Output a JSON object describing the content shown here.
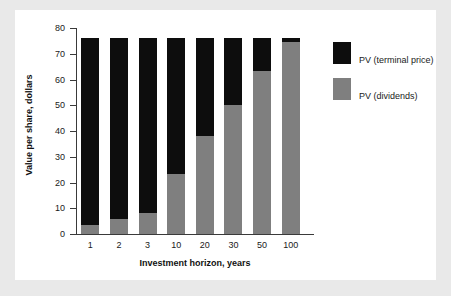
{
  "figure": {
    "background_color": "#e9e9e9",
    "panel_color": "#ffffff"
  },
  "colors": {
    "terminal_price": "#0d0d0d",
    "dividends": "#7f7f7f",
    "axis": "#3a3a3a",
    "text": "#1a1a1a"
  },
  "legend": {
    "position": "right",
    "entries": [
      {
        "label": "PV (terminal price)",
        "color": "#0d0d0d",
        "swatch": "legend-swatch-terminal-price"
      },
      {
        "label": "PV (dividends)",
        "color": "#7f7f7f",
        "swatch": "legend-swatch-dividends"
      }
    ]
  },
  "chart_data": {
    "type": "bar",
    "stacked": true,
    "title": "",
    "xlabel": "Investment horizon, years",
    "ylabel": "Value per share, dollars",
    "categories": [
      "1",
      "2",
      "3",
      "10",
      "20",
      "30",
      "50",
      "100"
    ],
    "ylim": [
      0,
      80
    ],
    "yticks": [
      0,
      10,
      20,
      30,
      40,
      50,
      60,
      70,
      80
    ],
    "ytick_labels": [
      "0",
      "10",
      "20",
      "30",
      "40",
      "50",
      "60",
      "70",
      "80"
    ],
    "grid": false,
    "legend_position": "right",
    "series": [
      {
        "name": "PV (dividends)",
        "color": "#7f7f7f",
        "values": [
          3.5,
          6.0,
          8.0,
          23.5,
          38.0,
          50.0,
          63.5,
          74.5
        ]
      },
      {
        "name": "PV (terminal price)",
        "color": "#0d0d0d",
        "values": [
          72.5,
          70.0,
          68.0,
          52.5,
          38.0,
          26.0,
          12.5,
          1.5
        ]
      }
    ],
    "totals": [
      76,
      76,
      76,
      76,
      76,
      76,
      76,
      76
    ]
  }
}
